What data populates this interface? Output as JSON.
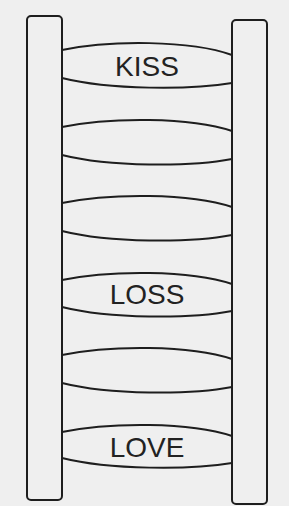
{
  "diagram": {
    "title": "",
    "background": "#efefef",
    "stroke_color": "#1e1e1e",
    "text_color": "#222222",
    "rails": [
      {
        "side": "left",
        "x": 27,
        "y": 16,
        "width": 35,
        "height": 484
      },
      {
        "side": "right",
        "x": 232,
        "y": 20,
        "width": 35,
        "height": 484
      }
    ],
    "rungs": [
      {
        "index": 1,
        "label": "KISS",
        "top": 45,
        "bottom": 87
      },
      {
        "index": 2,
        "label": "",
        "top": 122,
        "bottom": 164
      },
      {
        "index": 3,
        "label": "",
        "top": 197,
        "bottom": 239
      },
      {
        "index": 4,
        "label": "LOSS",
        "top": 274,
        "bottom": 315
      },
      {
        "index": 5,
        "label": "",
        "top": 350,
        "bottom": 392
      },
      {
        "index": 6,
        "label": "LOVE",
        "top": 427,
        "bottom": 467
      }
    ]
  }
}
